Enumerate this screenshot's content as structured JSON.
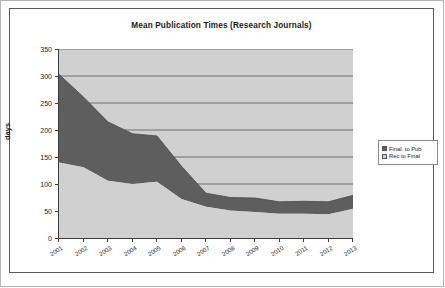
{
  "chart_data": {
    "type": "area",
    "stacked": true,
    "title": "Mean Publication Times (Research Journals)",
    "xlabel": "",
    "ylabel": "days",
    "ylim": [
      0,
      350
    ],
    "ytick_step": 50,
    "yticks": [
      "0",
      "50",
      "100",
      "150",
      "200",
      "250",
      "300",
      "350"
    ],
    "grid": true,
    "grid_orientation": "horizontal",
    "legend_position": "right",
    "categories": [
      "2001",
      "2002",
      "2003",
      "2004",
      "2005",
      "2006",
      "2007",
      "2008",
      "2009",
      "2010",
      "2011",
      "2012",
      "2013"
    ],
    "series": [
      {
        "name": "Rec to Final",
        "color": "#d0d0d0",
        "values": [
          140,
          131,
          106,
          100,
          104,
          72,
          58,
          51,
          48,
          45,
          45,
          44,
          54
        ]
      },
      {
        "name": "Final. to Pub",
        "color": "#5e5e5e",
        "values": [
          163,
          130,
          109,
          93,
          85,
          61,
          25,
          24,
          26,
          22,
          23,
          23,
          25
        ]
      }
    ],
    "totals": [
      303,
      261,
      215,
      193,
      189,
      133,
      83,
      75,
      74,
      67,
      68,
      67,
      79
    ]
  },
  "legend": {
    "items": [
      {
        "label": "Final. to Pub",
        "color": "#5e5e5e"
      },
      {
        "label": "Rec to Final",
        "color": "#d0d0d0"
      }
    ]
  },
  "colors": {
    "plot_background": "#d0d0d0",
    "band_lower": "#d0d0d0",
    "band_upper": "#5e5e5e",
    "axis": "#3c3c3c",
    "gridline": "#555555",
    "chart_border": "#5a5a5a",
    "outer_border": "#b4b4b4"
  }
}
